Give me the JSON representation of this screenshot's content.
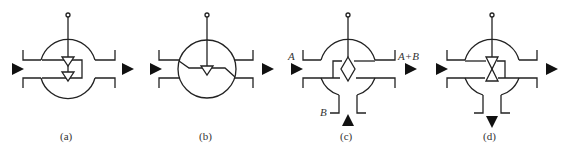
{
  "figure": {
    "panels": [
      {
        "id": "a",
        "caption": "(a)",
        "type": "two stacked check triangles with bypass loop"
      },
      {
        "id": "b",
        "caption": "(b)",
        "type": "single triangle with sloped flow path in circle"
      },
      {
        "id": "c",
        "caption": "(c)",
        "type": "mixing diamond with side inlet",
        "labels": {
          "inlet_a": "A",
          "outlet": "A+B",
          "inlet_b": "B"
        }
      },
      {
        "id": "d",
        "caption": "(d)",
        "type": "opposed triangles with bottom outlet"
      }
    ],
    "colors": {
      "stroke": "#222222",
      "background": "#ffffff"
    }
  }
}
